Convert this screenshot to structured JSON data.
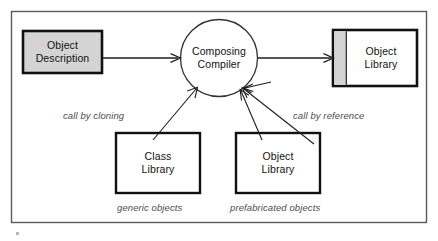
{
  "figure": {
    "kind": "block-flow-diagram",
    "frame": {
      "border_color": "#555555"
    },
    "background": "#ffffff"
  },
  "nodes": {
    "object_description": {
      "label_line1": "Object",
      "label_line2": "Description",
      "shape": "rectangle",
      "fill": "#d4d4d4",
      "border": "#111111"
    },
    "composing_compiler": {
      "label_line1": "Composing",
      "label_line2": "Compiler",
      "shape": "circle",
      "fill": "#ffffff",
      "border": "#333333"
    },
    "object_library_output": {
      "label_line1": "Object",
      "label_line2": "Library",
      "shape": "rectangle-with-spine",
      "fill": "#ffffff",
      "spine_fill": "#d4d4d4",
      "border": "#111111"
    },
    "class_library": {
      "label_line1": "Class",
      "label_line2": "Library",
      "shape": "rectangle",
      "fill": "#ffffff",
      "border": "#111111"
    },
    "object_library_input": {
      "label_line1": "Object",
      "label_line2": "Library",
      "shape": "rectangle",
      "fill": "#ffffff",
      "border": "#111111"
    }
  },
  "edge_labels": {
    "call_by_cloning": "call by cloning",
    "call_by_reference": "call by reference"
  },
  "captions": {
    "generic_objects": "generic objects",
    "prefabricated_objects": "prefabricated objects"
  },
  "edges": [
    {
      "name": "description-to-compiler",
      "from": "object_description",
      "to": "composing_compiler",
      "style": "solid-arrow"
    },
    {
      "name": "compiler-to-object-library",
      "from": "composing_compiler",
      "to": "object_library_output",
      "style": "solid-arrow"
    },
    {
      "name": "class-library-to-compiler",
      "from": "class_library",
      "to": "composing_compiler",
      "style": "solid-arrow",
      "label": "call by cloning"
    },
    {
      "name": "object-library-to-compiler",
      "from": "object_library_input",
      "to": "composing_compiler",
      "style": "solid-arrow",
      "label": "call by reference"
    }
  ]
}
